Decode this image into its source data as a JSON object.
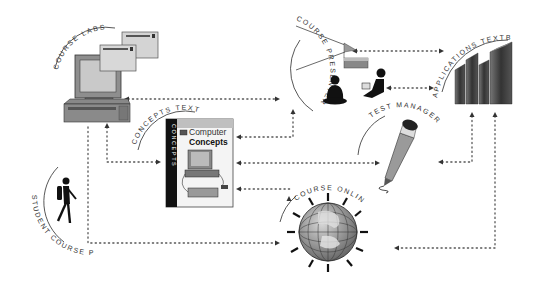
{
  "diagram": {
    "nodes": [
      {
        "id": "course_labs",
        "label": "COURSE LABS",
        "icon": "computer-with-windows-icon"
      },
      {
        "id": "course_presenter",
        "label": "COURSE PRESENTER",
        "icon": "projector-audience-icon"
      },
      {
        "id": "applications_textbooks",
        "label": "APPLICATIONS TEXTBOOKS",
        "icon": "books-icon"
      },
      {
        "id": "concepts_textbooks",
        "label": "CONCEPTS TEXTBOOKS",
        "icon": "book-cover-icon"
      },
      {
        "id": "test_manager",
        "label": "TEST MANAGER",
        "icon": "pencil-icon"
      },
      {
        "id": "course_online",
        "label": "COURSE ONLINE",
        "icon": "globe-icon"
      },
      {
        "id": "student_course_pak",
        "label": "STUDENT COURSE PAK",
        "icon": "student-walking-icon"
      }
    ],
    "book_cover": {
      "spine": "CONCEPTS",
      "title_line1": "Computer",
      "title_line2": "Concepts"
    },
    "colors": {
      "ink": "#333333",
      "mid_gray": "#9a9a9a",
      "light_gray": "#d0d0d0",
      "dark": "#1a1a1a"
    }
  }
}
